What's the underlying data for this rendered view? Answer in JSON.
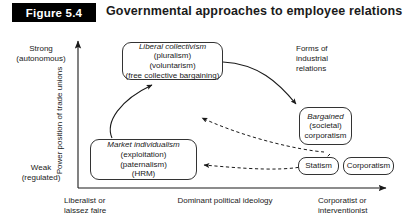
{
  "header": {
    "figure_tag": "Figure 5.4",
    "title": "Governmental approaches to employee relations"
  },
  "axes": {
    "y_top_line1": "Strong",
    "y_top_line2": "(autonomous)",
    "y_bottom_line1": "Weak",
    "y_bottom_line2": "(regulated)",
    "y_title": "Power position of trade unions",
    "x_left_line1": "Liberalist or",
    "x_left_line2": "laissez faire",
    "x_title": "Dominant political ideology",
    "x_right_line1": "Corporatist or",
    "x_right_line2": "interventionist"
  },
  "annotation": {
    "forms_line1": "Forms of",
    "forms_line2": "industrial",
    "forms_line3": "relations"
  },
  "nodes": {
    "liberal_collectivism": {
      "line1": "Liberal collectivism",
      "line2": "(pluralism)",
      "line3": "(voluntarism)",
      "line4": "(free collective bargaining)"
    },
    "market_individualism": {
      "line1": "Market individualism",
      "line2": "(exploitation)",
      "line3": "(paternalism)",
      "line4": "(HRM)"
    },
    "bargained_corporatism": {
      "line1": "Bargained",
      "line2": "(societal)",
      "line3": "corporatism"
    },
    "statism": {
      "label": "Statism"
    },
    "corporatism": {
      "label": "Corporatism"
    }
  },
  "colors": {
    "tag_background": "#000000",
    "tag_text": "#ffffff",
    "stroke": "#333333",
    "text": "#1a1a1a",
    "page": "#ffffff"
  }
}
